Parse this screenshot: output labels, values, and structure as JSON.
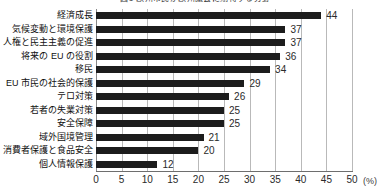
{
  "chart_data": {
    "type": "bar",
    "orientation": "horizontal",
    "title": "図1 欧州市民が欧州議会に期待する分野",
    "xlabel": "(%)",
    "ylabel": "",
    "unit": "(%)",
    "xlim": [
      0,
      50
    ],
    "xticks": [
      0,
      5,
      10,
      15,
      20,
      25,
      30,
      35,
      40,
      45,
      50
    ],
    "grid": true,
    "legend": false,
    "bar_color": "#1c1c1c",
    "categories": [
      "経済成長",
      "気候変動と環境保護",
      "人権と民主主義の促進",
      "将来の EU の役割",
      "移民",
      "EU 市民の社会的保護",
      "テロ対策",
      "若者の失業対策",
      "安全保障",
      "域外国境管理",
      "消費者保護と食品安全",
      "個人情報保護"
    ],
    "values": [
      44,
      37,
      37,
      36,
      34,
      29,
      26,
      25,
      25,
      21,
      20,
      12
    ],
    "value_labels": [
      "44",
      "37",
      "37",
      "36",
      "34",
      "29",
      "26",
      "25",
      "25",
      "21",
      "20",
      "12"
    ]
  }
}
